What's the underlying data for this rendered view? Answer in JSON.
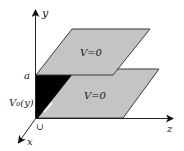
{
  "diagram": {
    "axes": {
      "y_label": "y",
      "z_label": "z",
      "x_label": "x"
    },
    "labels": {
      "height_marker": "a",
      "potential_function": "V₀(y)",
      "upper_plane": "V=0",
      "lower_plane": "V=0",
      "origin_mark": "∪"
    },
    "colors": {
      "plane_fill": "#c4c4c4",
      "plane_edge": "#3a3a3a",
      "end_face": "#000000",
      "axis": "#222222",
      "background": "#ffffff"
    }
  }
}
